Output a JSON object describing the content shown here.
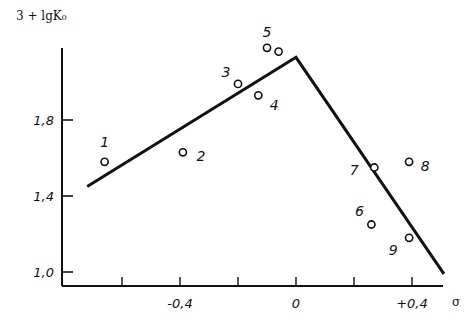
{
  "chart_data": {
    "type": "scatter",
    "title": "",
    "ylabel": "3 + lgK₀",
    "xlabel": "σ",
    "xlim": [
      -0.8,
      0.52
    ],
    "ylim": [
      0.93,
      2.2
    ],
    "x_ticks": [
      {
        "value": -0.6,
        "label": ""
      },
      {
        "value": -0.4,
        "label": "-0,4"
      },
      {
        "value": -0.2,
        "label": ""
      },
      {
        "value": 0.0,
        "label": "0"
      },
      {
        "value": 0.2,
        "label": ""
      },
      {
        "value": 0.4,
        "label": "+0,4"
      }
    ],
    "y_ticks": [
      {
        "value": 1.0,
        "label": "1,0"
      },
      {
        "value": 1.4,
        "label": "1,4"
      },
      {
        "value": 1.8,
        "label": "1,8"
      }
    ],
    "grid": false,
    "points": [
      {
        "label": "1",
        "x": -0.66,
        "y": 1.58
      },
      {
        "label": "2",
        "x": -0.39,
        "y": 1.63
      },
      {
        "label": "3",
        "x": -0.2,
        "y": 1.99
      },
      {
        "label": "4",
        "x": -0.13,
        "y": 1.93
      },
      {
        "label": "5",
        "x": -0.1,
        "y": 2.18
      },
      {
        "label": "",
        "x": -0.06,
        "y": 2.16
      },
      {
        "label": "6",
        "x": 0.26,
        "y": 1.25
      },
      {
        "label": "7",
        "x": 0.27,
        "y": 1.55
      },
      {
        "label": "8",
        "x": 0.39,
        "y": 1.58
      },
      {
        "label": "9",
        "x": 0.39,
        "y": 1.18
      }
    ],
    "fit_line": [
      {
        "x": -0.72,
        "y": 1.45
      },
      {
        "x": 0.0,
        "y": 2.13
      },
      {
        "x": 0.51,
        "y": 0.99
      }
    ]
  }
}
